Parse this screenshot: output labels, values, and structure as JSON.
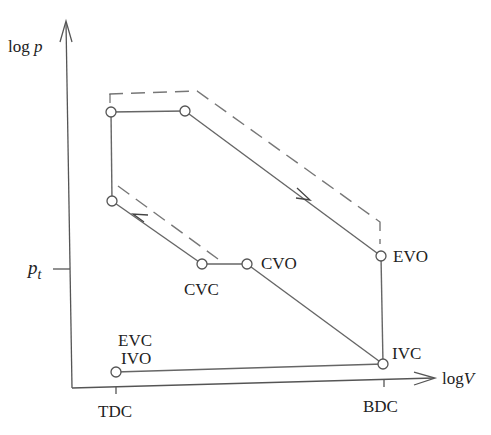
{
  "diagram": {
    "axes": {
      "y_label": {
        "prefix": "log ",
        "var": "p"
      },
      "x_label": {
        "prefix": "log",
        "var": "V"
      },
      "y_tick": {
        "var": "p",
        "sub": "t"
      },
      "x_ticks": [
        {
          "label": "TDC"
        },
        {
          "label": "BDC"
        }
      ]
    },
    "points": [
      {
        "id": "top-left",
        "label": ""
      },
      {
        "id": "top-right",
        "label": ""
      },
      {
        "id": "EVO",
        "label": "EVO"
      },
      {
        "id": "IVC",
        "label": "IVC"
      },
      {
        "id": "CVO",
        "label": "CVO"
      },
      {
        "id": "CVC",
        "label": "CVC"
      },
      {
        "id": "mid-left",
        "label": ""
      },
      {
        "id": "IVO",
        "label": "IVO"
      },
      {
        "id": "EVC",
        "label": "EVC"
      }
    ],
    "labels": {
      "evo": "EVO",
      "ivc": "IVC",
      "cvo": "CVO",
      "cvc": "CVC",
      "evc": "EVC",
      "ivo": "IVO"
    },
    "colors": {
      "line": "#666666",
      "axis": "#555555",
      "text": "#222222",
      "background": "#ffffff"
    }
  }
}
